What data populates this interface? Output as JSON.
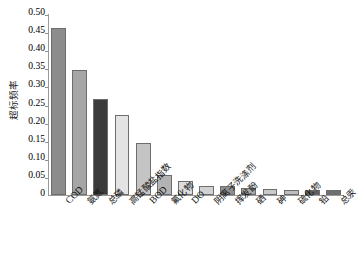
{
  "chart_data": {
    "type": "bar",
    "title": "",
    "xlabel": "",
    "ylabel": "超标频率",
    "ylim": [
      0,
      0.5
    ],
    "yticks": [
      "0",
      "0.05",
      "0.10",
      "0.15",
      "0.20",
      "0.25",
      "0.30",
      "0.35",
      "0.40",
      "0.45",
      "0.50"
    ],
    "ytick_values": [
      0,
      0.05,
      0.1,
      0.15,
      0.2,
      0.25,
      0.3,
      0.35,
      0.4,
      0.45,
      0.5
    ],
    "grid": false,
    "legend": "none",
    "categories": [
      "COD",
      "氨氮",
      "总磷",
      "高锰酸盐指数",
      "BOD",
      "氟化物",
      "DO",
      "阴离子洗涤剂",
      "挥发酚",
      "硒",
      "砷",
      "硫化物",
      "铅",
      "总汞"
    ],
    "category_scripts": [
      "latin",
      "cjk",
      "cjk",
      "cjk",
      "latin",
      "cjk",
      "latin",
      "cjk",
      "cjk",
      "cjk",
      "cjk",
      "cjk",
      "cjk",
      "cjk"
    ],
    "values": [
      0.461,
      0.345,
      0.265,
      0.221,
      0.143,
      0.055,
      0.039,
      0.026,
      0.025,
      0.018,
      0.017,
      0.014,
      0.013,
      0.013
    ],
    "bar_colors": [
      "#8c8c8c",
      "#a6a6a6",
      "#3b3b3b",
      "#e3e3e3",
      "#c4c4c4",
      "#b3b3b3",
      "#dcdcdc",
      "#d2d2d2",
      "#8f8f8f",
      "#a9a9a9",
      "#c9c9c9",
      "#bdbdbd",
      "#5e5e5e",
      "#6f6f6f"
    ],
    "bar_edge_color": "#6d6d6d",
    "axis_color": "#9a9a9a",
    "background": "#ffffff"
  }
}
